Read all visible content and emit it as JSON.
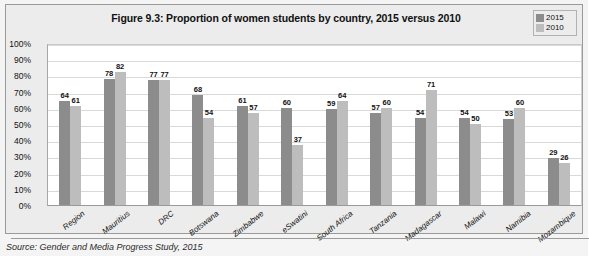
{
  "figure": {
    "title": "Figure 9.3: Proportion of women students by country, 2015 versus 2010",
    "source": "Source: Gender and Media Progress Study, 2015"
  },
  "legend": {
    "position": "top-right",
    "entries": [
      {
        "label": "2015",
        "color": "#8c8c8c"
      },
      {
        "label": "2010",
        "color": "#bdbdbd"
      }
    ]
  },
  "chart_data": {
    "type": "bar",
    "title": "Figure 9.3: Proportion of women students by country, 2015 versus 2010",
    "xlabel": "",
    "ylabel": "",
    "ylim": [
      0,
      100
    ],
    "grid": true,
    "legend_position": "top-right",
    "categories": [
      "Region",
      "Mauritius",
      "DRC",
      "Botswana",
      "Zimbabwe",
      "eSwatini",
      "South Africa",
      "Tanzania",
      "Madagascar",
      "Malawi",
      "Namibia",
      "Mozambique"
    ],
    "ytick_labels": [
      "100%",
      "90%",
      "80%",
      "70%",
      "60%",
      "50%",
      "40%",
      "30%",
      "20%",
      "10%",
      "0%"
    ],
    "ytick_values": [
      100,
      90,
      80,
      70,
      60,
      50,
      40,
      30,
      20,
      10,
      0
    ],
    "series": [
      {
        "name": "2015",
        "color": "#8c8c8c",
        "values": [
          64,
          78,
          77,
          68,
          61,
          60,
          59,
          57,
          54,
          54,
          53,
          29
        ]
      },
      {
        "name": "2010",
        "color": "#bdbdbd",
        "values": [
          61,
          82,
          77,
          54,
          57,
          37,
          64,
          60,
          71,
          50,
          60,
          26
        ]
      }
    ]
  }
}
